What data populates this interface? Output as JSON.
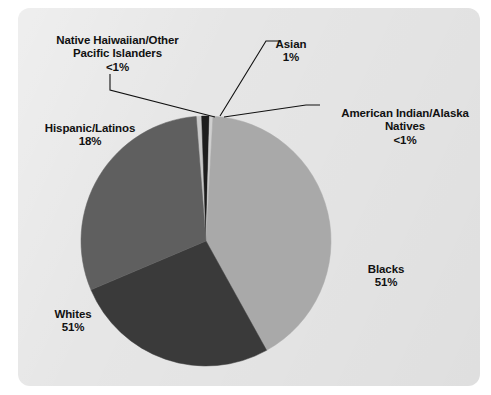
{
  "figure": {
    "panel_color": "#e6e6e6",
    "background_color": "#ffffff"
  },
  "chart_data": {
    "type": "pie",
    "title": "",
    "subtitle": "",
    "xlabel": "",
    "ylabel": "",
    "grid": false,
    "legend_position": "callout-labels",
    "note": "Percentages as printed on the chart; they are category rates and do not sum to 100%.",
    "categories": [
      "Asian",
      "American Indian/Alaska Natives",
      "Blacks",
      "Whites",
      "Hispanic/Latinos",
      "Native Haiwaiian/Other Pacific Islanders"
    ],
    "values": [
      1,
      0.4,
      51,
      51,
      18,
      0.4
    ],
    "value_labels": [
      "1%",
      "<1%",
      "51%",
      "51%",
      "18%",
      "<1%"
    ],
    "colors": [
      "#1d1d1d",
      "#cfcfcf",
      "#a9a9a9",
      "#3a3a3a",
      "#5f5f5f",
      "#c9c9c9"
    ],
    "slices": [
      {
        "name": "Native Haiwaiian/Other Pacific Islanders",
        "label_line1": "Native Haiwaiian/Other",
        "label_line2": "Pacific Islanders",
        "percent_label": "<1%",
        "value": 0.4,
        "color": "#c9c9c9",
        "start_angle": 355.5,
        "end_angle": 358.0,
        "leader": true
      },
      {
        "name": "Asian",
        "label_line1": "Asian",
        "label_line2": "",
        "percent_label": "1%",
        "value": 1,
        "color": "#1d1d1d",
        "start_angle": 358.0,
        "end_angle": 361.6,
        "leader": true
      },
      {
        "name": "American Indian/Alaska Natives",
        "label_line1": "American Indian/Alaska",
        "label_line2": "Natives",
        "percent_label": "<1%",
        "value": 0.4,
        "color": "#cfcfcf",
        "start_angle": 361.6,
        "end_angle": 363.2,
        "leader": true
      },
      {
        "name": "Blacks",
        "label_line1": "Blacks",
        "label_line2": "",
        "percent_label": "51%",
        "value": 51,
        "color": "#a9a9a9",
        "start_angle": 363.2,
        "end_angle": 511.0,
        "leader": false
      },
      {
        "name": "Whites",
        "label_line1": "Whites",
        "label_line2": "",
        "percent_label": "51%",
        "value": 51,
        "color": "#3a3a3a",
        "start_angle": 511.0,
        "end_angle": 607.0,
        "leader": false
      },
      {
        "name": "Hispanic/Latinos",
        "label_line1": "Hispanic/Latinos",
        "label_line2": "",
        "percent_label": "18%",
        "value": 18,
        "color": "#5f5f5f",
        "start_angle": 607.0,
        "end_angle": 715.5,
        "leader": false
      }
    ]
  },
  "labels": {
    "nhopi": {
      "line1": "Native Haiwaiian/Other",
      "line2": "Pacific Islanders",
      "pct": "<1%"
    },
    "asian": {
      "line1": "Asian",
      "line2": "",
      "pct": "1%"
    },
    "aian": {
      "line1": "American Indian/Alaska",
      "line2": "Natives",
      "pct": "<1%"
    },
    "hispanic": {
      "line1": "Hispanic/Latinos",
      "line2": "",
      "pct": "18%"
    },
    "whites": {
      "line1": "Whites",
      "line2": "",
      "pct": "51%"
    },
    "blacks": {
      "line1": "Blacks",
      "line2": "",
      "pct": "51%"
    }
  }
}
